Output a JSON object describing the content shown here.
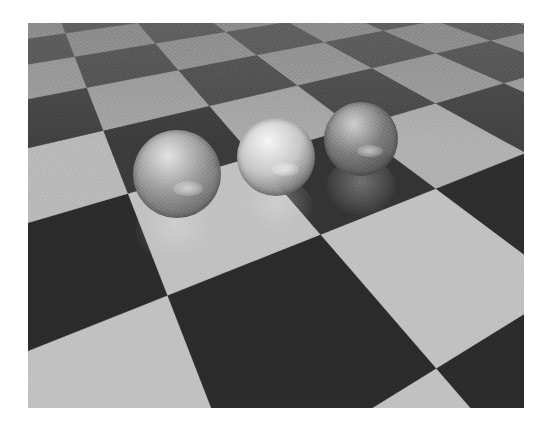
{
  "scene": {
    "title": "Ray-traced glass spheres on checkerboard floor",
    "frame": {
      "x": 28,
      "y": 23,
      "width": 496,
      "height": 385
    },
    "colors": {
      "light_tile": "#c2c2c2",
      "dark_tile": "#2c2c2c",
      "background": "#ffffff"
    },
    "floor": {
      "comment_free": true,
      "horizon_y": -160,
      "focal": 520,
      "cam_height": 1.0,
      "tile_size": 0.42,
      "rotation_deg": 28,
      "offset_x": 0.12,
      "offset_z": 0.05,
      "center_x": 248
    },
    "spheres": [
      {
        "name": "left-glass-sphere",
        "cx": 149,
        "cy": 151,
        "r": 44,
        "tint": "#9a9a9a",
        "highlight": "#e4e4e4"
      },
      {
        "name": "middle-glass-sphere",
        "cx": 248,
        "cy": 134,
        "r": 39,
        "tint": "#c8c8c8",
        "highlight": "#f6f6f6"
      },
      {
        "name": "right-glass-sphere",
        "cx": 333,
        "cy": 116,
        "r": 37,
        "tint": "#7e7e7e",
        "highlight": "#cfcfcf"
      }
    ]
  }
}
